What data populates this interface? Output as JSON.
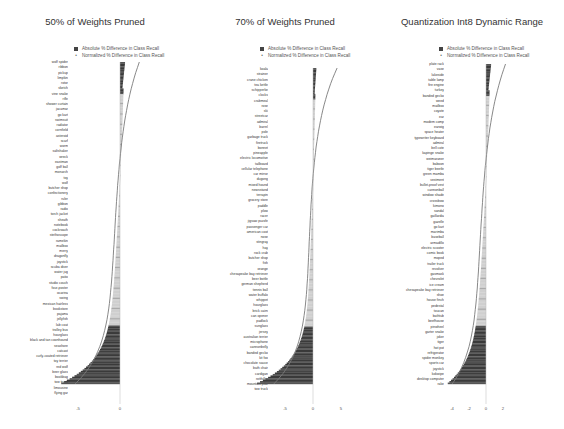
{
  "legend": {
    "absolute": "Absolute % Difference in Class Recall",
    "normalized": "Normalized % Difference in Class Recall"
  },
  "colors": {
    "bar_dark": "#3a3a3a",
    "bar_light": "#cfcfcf",
    "line": "#7a7a7a",
    "zero_axis": "#bbbbbb"
  },
  "chart_data": [
    {
      "type": "bar",
      "orientation": "horizontal",
      "title": "50% of Weights Pruned",
      "xlabel": "",
      "ylabel": "",
      "xticks": [
        "-5",
        "0"
      ],
      "xlim": [
        -8,
        3
      ],
      "legend": [
        "Absolute % Difference in Class Recall",
        "Normalized % Difference in Class Recall"
      ],
      "legend_position": "top",
      "grid": false,
      "categories": [
        "wolf spider",
        "ribbon",
        "pickup",
        "limpkin",
        "rotor",
        "sketch",
        "vine snake",
        "rifle",
        "shower curtain",
        "jacamar",
        "go kart",
        "swimsuit",
        "radiator",
        "cornfield",
        "asteroid",
        "scarf",
        "worm",
        "saltshaker",
        "wreck",
        "eastman",
        "golf ball",
        "monarch",
        "toy",
        "wolf",
        "butcher shop",
        "confectionery",
        "ruler",
        "gibbon",
        "radio",
        "torch jacket",
        "sheath",
        "notebook",
        "cockroach",
        "stethoscope",
        "ramekin",
        "mailbox",
        "merry",
        "dragonfly",
        "joystick",
        "scuba diver",
        "water jug",
        "patio",
        "studio couch",
        "four-poster",
        "ocarina",
        "swing",
        "mexican hairless",
        "bookstore",
        "pajama",
        "jellyfish",
        "lab coat",
        "trolley bus",
        "hourglass",
        "black and tan coonhound",
        "seashore",
        "catcast",
        "curly-coated retriever",
        "toy terrier",
        "red wolf",
        "beer glass",
        "bookbag",
        "tow truck",
        "limousine",
        "flying gar"
      ],
      "series": [
        {
          "name": "Absolute % Difference in Class Recall",
          "values_summary": "most classes drop between 0 and -3; top classes slightly positive near +0.5; bottom class (flying gar) about -7"
        },
        {
          "name": "Normalized % Difference in Class Recall",
          "values_summary": "smooth curve from about +2 at top to about -6 at bottom"
        }
      ],
      "range_approx": {
        "min": -7,
        "max": 2
      }
    },
    {
      "type": "bar",
      "orientation": "horizontal",
      "title": "70% of Weights Pruned",
      "xlabel": "",
      "ylabel": "",
      "xticks": [
        "-5",
        "0",
        "5"
      ],
      "xlim": [
        -10,
        8
      ],
      "legend": [
        "Absolute % Difference in Class Recall",
        "Normalized % Difference in Class Recall"
      ],
      "legend_position": "top",
      "grid": false,
      "categories": [
        "koala",
        "strainer",
        "crane chicken",
        "tea kettle",
        "schipperke",
        "clocks",
        "crabmeal",
        "rose",
        "ski",
        "streetcar",
        "admiral",
        "barrel",
        "pole",
        "garbage truck",
        "firetruck",
        "bonnet",
        "pineapple",
        "electric locomotive",
        "tailboard",
        "cellular telephone",
        "car mirror",
        "dugong",
        "mixed hound",
        "newsstand",
        "terrapin",
        "grocery store",
        "paddle",
        "plow",
        "racer",
        "jigsaw puzzle",
        "passenger car",
        "american coot",
        "nose",
        "stingray",
        "hay",
        "rock crab",
        "butcher shop",
        "fish",
        "orange",
        "chesapeake bay retriever",
        "beer bottle",
        "german shepherd",
        "tennis ball",
        "water buffalo",
        "whippet",
        "hourglass",
        "brick cairn",
        "can opener",
        "padlock",
        "sunglass",
        "jersey",
        "australian terrier",
        "microphone",
        "cannonbelly",
        "banded gecko",
        "kit fox",
        "chocolate sauce",
        "bath chair",
        "cardigan",
        "rotthiller",
        "mountain pike",
        "tow truck"
      ],
      "series": [
        {
          "name": "Absolute % Difference in Class Recall",
          "values_summary": "most classes drop between 0 and -4; top classes slightly positive near +0.5; bottom class about -10"
        },
        {
          "name": "Normalized % Difference in Class Recall",
          "values_summary": "smooth curve from about +4 at top to about -8 at bottom"
        }
      ],
      "range_approx": {
        "min": -10,
        "max": 4
      }
    },
    {
      "type": "bar",
      "orientation": "horizontal",
      "title": "Quantization Int8 Dynamic Range",
      "xlabel": "",
      "ylabel": "",
      "xticks": [
        "-4",
        "-2",
        "0",
        "2"
      ],
      "xlim": [
        -5,
        3
      ],
      "legend": [
        "Absolute % Difference in Class Recall",
        "Normalized % Difference in Class Recall"
      ],
      "legend_position": "top",
      "grid": false,
      "categories": [
        "plate rack",
        "vase",
        "lakeside",
        "table lamp",
        "fire engine",
        "turkey",
        "banded gecko",
        "weed",
        "mailbox",
        "coyote",
        "ear",
        "modem comp",
        "earwig",
        "space heater",
        "typewriter keyboard",
        "admiral",
        "bell cote",
        "kapinge snake",
        "weimaraner",
        "baboon",
        "tiger beetle",
        "green mamba",
        "vestment",
        "bullet-proof vest",
        "cannonball",
        "window shade",
        "crossbow",
        "kimono",
        "sandal",
        "gaillardia",
        "gazelle",
        "go kart",
        "marimba",
        "baseball",
        "armadillo",
        "electric scooter",
        "comic book",
        "moped",
        "trailer truck",
        "revolver",
        "gasmask",
        "chevrolet",
        "ice cream",
        "chesapeake bay retriever",
        "shoe",
        "house finch",
        "pedestal",
        "toucan",
        "bathtub",
        "beefhouse",
        "pinwheel",
        "garter snake",
        "joker",
        "tiger",
        "hot pot",
        "refrigerator",
        "spider monkey",
        "sports car",
        "joystick",
        "kokwipe",
        "desktop computer",
        "rake"
      ],
      "series": [
        {
          "name": "Absolute % Difference in Class Recall",
          "values_summary": "most classes drop between 0 and -2; top classes slightly positive near +0.5; bottom class (rake) about -4.5"
        },
        {
          "name": "Normalized % Difference in Class Recall",
          "values_summary": "smooth curve from about +2 at top to about -3.5 at bottom"
        }
      ],
      "range_approx": {
        "min": -4.5,
        "max": 2
      }
    }
  ]
}
